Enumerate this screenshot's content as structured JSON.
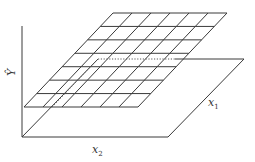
{
  "diagram": {
    "type": "3d-response-surface-grid",
    "colors": {
      "stroke": "#3a3a3a",
      "dotted": "#5a5a5a",
      "text": "#333333",
      "background": "#ffffff"
    },
    "labels": {
      "y_axis": {
        "text": "Ŷ",
        "x": 8,
        "y": 75
      },
      "x1": {
        "main": "x",
        "sub": "1",
        "x": 208,
        "y": 106
      },
      "x2": {
        "main": "x",
        "sub": "2",
        "x": 92,
        "y": 153
      }
    },
    "vertical_axis": {
      "x": 22,
      "y_top": 26,
      "y_bottom": 137
    },
    "base_plane": {
      "corners": [
        [
          22,
          137
        ],
        [
          168,
          137
        ],
        [
          244,
          59
        ],
        [
          175,
          59
        ]
      ],
      "edges_drawn": [
        [
          [
            22,
            137
          ],
          [
            168,
            137
          ]
        ],
        [
          [
            168,
            137
          ],
          [
            244,
            59
          ]
        ],
        [
          [
            175,
            59
          ],
          [
            244,
            59
          ]
        ],
        [
          [
            22,
            137
          ],
          [
            98,
            59
          ]
        ]
      ]
    },
    "surface_grid": {
      "bottom_left": [
        24,
        107
      ],
      "bottom_right": [
        138,
        107
      ],
      "top_left": [
        113,
        13
      ],
      "top_right": [
        227,
        13
      ],
      "rows": 7,
      "cols": 6
    },
    "dotted_lines": [
      {
        "from": [
          52,
          107
        ],
        "to": [
          98,
          59
        ]
      },
      {
        "from": [
          98,
          59
        ],
        "to": [
          175,
          59
        ]
      }
    ]
  }
}
